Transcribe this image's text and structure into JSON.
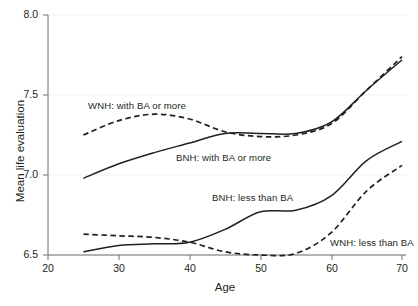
{
  "chart_data": {
    "type": "line",
    "title": "",
    "xlabel": "Age",
    "ylabel": "Mean life evaluation",
    "xlim": [
      20,
      70
    ],
    "ylim": [
      6.5,
      8.0
    ],
    "xticks": [
      20,
      30,
      40,
      50,
      60,
      70
    ],
    "yticks": [
      "6.5",
      "7.0",
      "7.5",
      "8.0"
    ],
    "ytick_values": [
      6.5,
      7.0,
      7.5,
      8.0
    ],
    "grid": "horizontal-faint",
    "legend": "inline-annotations",
    "x": [
      25,
      30,
      35,
      40,
      45,
      50,
      55,
      60,
      65,
      70
    ],
    "series": [
      {
        "name": "WNH: with BA or more",
        "style": "dashed",
        "color": "#231f20",
        "values": [
          7.25,
          7.34,
          7.38,
          7.35,
          7.27,
          7.24,
          7.25,
          7.32,
          7.53,
          7.74
        ]
      },
      {
        "name": "BNH: with BA or more",
        "style": "solid",
        "color": "#231f20",
        "values": [
          6.98,
          7.07,
          7.14,
          7.2,
          7.26,
          7.26,
          7.26,
          7.33,
          7.53,
          7.72
        ]
      },
      {
        "name": "BNH: less than BA",
        "style": "solid",
        "color": "#231f20",
        "values": [
          6.52,
          6.56,
          6.57,
          6.58,
          6.66,
          6.77,
          6.78,
          6.87,
          7.09,
          7.21
        ]
      },
      {
        "name": "WNH: less than BA",
        "style": "dashed",
        "color": "#231f20",
        "values": [
          6.63,
          6.62,
          6.61,
          6.58,
          6.52,
          6.5,
          6.51,
          6.64,
          6.9,
          7.06
        ]
      }
    ],
    "annotations": [
      {
        "text": "WNH: with BA or more",
        "x_px": 88,
        "y_px": 100
      },
      {
        "text": "BNH: with BA or more",
        "x_px": 176,
        "y_px": 152
      },
      {
        "text": "BNH: less than BA",
        "x_px": 212,
        "y_px": 192
      },
      {
        "text": "WNH: less than BA",
        "x_px": 330,
        "y_px": 237
      }
    ]
  },
  "axes": {
    "ylabel": "Mean life evaluation",
    "xlabel": "Age",
    "yticks": [
      {
        "label": "8.0",
        "y_px": 15
      },
      {
        "label": "7.5",
        "y_px": 95
      },
      {
        "label": "7.0",
        "y_px": 175
      },
      {
        "label": "6.5",
        "y_px": 255
      }
    ],
    "xticks": [
      {
        "label": "20",
        "x_px": 48
      },
      {
        "label": "30",
        "x_px": 119
      },
      {
        "label": "40",
        "x_px": 190
      },
      {
        "label": "50",
        "x_px": 261
      },
      {
        "label": "60",
        "x_px": 332
      },
      {
        "label": "70",
        "x_px": 402
      }
    ]
  },
  "colors": {
    "line": "#231f20",
    "axis": "#6f6f6f",
    "grid": "#efefee",
    "background": "#ffffff"
  }
}
